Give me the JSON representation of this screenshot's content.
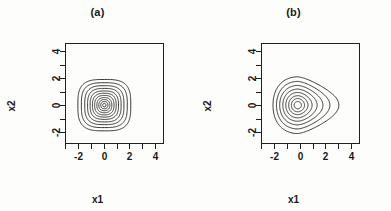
{
  "figure": {
    "background_color": "#fdfdfc",
    "ink_color": "#161616"
  },
  "panels": [
    {
      "id": "a",
      "title": "(a)",
      "xlabel": "x1",
      "ylabel": "x2"
    },
    {
      "id": "b",
      "title": "(b)",
      "xlabel": "x1",
      "ylabel": "x2"
    }
  ],
  "chart_data": [
    {
      "type": "line",
      "subtype": "contour",
      "title": "(a)",
      "xlabel": "x1",
      "ylabel": "x2",
      "xlim": [
        -3,
        4.6
      ],
      "ylim": [
        -2.8,
        4.6
      ],
      "xticks": [
        -3,
        -2,
        -1,
        0,
        1,
        2,
        3,
        4
      ],
      "xtick_labels": [
        "",
        "-2",
        "",
        "0",
        "",
        "2",
        "",
        "4"
      ],
      "yticks": [
        -2,
        -1,
        0,
        1,
        2,
        3,
        4
      ],
      "ytick_labels": [
        "-2",
        "",
        "0",
        "",
        "2",
        "",
        "4"
      ],
      "grid": false,
      "legend": "none",
      "description": "Nearly circular, concentric contours of a symmetric bivariate density centred at the origin",
      "center": [
        0.05,
        0.0
      ],
      "n_contours": 11,
      "contour_levels": [
        0.02,
        0.04,
        0.06,
        0.08,
        0.1,
        0.12,
        0.14,
        0.16,
        0.18,
        0.2,
        0.22
      ],
      "contour_radii_x": [
        2.05,
        1.78,
        1.52,
        1.3,
        1.1,
        0.92,
        0.75,
        0.58,
        0.43,
        0.28,
        0.13
      ],
      "contour_radii_y": [
        1.9,
        1.66,
        1.44,
        1.24,
        1.05,
        0.88,
        0.72,
        0.56,
        0.41,
        0.27,
        0.13
      ],
      "skew_x": 0.0,
      "squareness": [
        0.55,
        0.5,
        0.45,
        0.4,
        0.34,
        0.28,
        0.22,
        0.16,
        0.1,
        0.05,
        0.0
      ]
    },
    {
      "type": "line",
      "subtype": "contour",
      "title": "(b)",
      "xlabel": "x1",
      "ylabel": "x2",
      "xlim": [
        -3,
        4.6
      ],
      "ylim": [
        -2.8,
        4.6
      ],
      "xticks": [
        -3,
        -2,
        -1,
        0,
        1,
        2,
        3,
        4
      ],
      "xtick_labels": [
        "",
        "-2",
        "",
        "0",
        "",
        "2",
        "",
        "4"
      ],
      "yticks": [
        -2,
        -1,
        0,
        1,
        2,
        3,
        4
      ],
      "ytick_labels": [
        "-2",
        "",
        "0",
        "",
        "2",
        "",
        "4"
      ],
      "grid": false,
      "legend": "none",
      "description": "Right-skewed teardrop-shaped concentric contours of an asymmetric bivariate density centred near the origin",
      "center": [
        -0.15,
        0.0
      ],
      "n_contours": 8,
      "contour_levels": [
        0.02,
        0.05,
        0.08,
        0.11,
        0.14,
        0.17,
        0.2,
        0.23
      ],
      "contour_radii_x": [
        2.15,
        1.8,
        1.5,
        1.22,
        0.96,
        0.72,
        0.5,
        0.28
      ],
      "contour_radii_y": [
        2.1,
        1.76,
        1.46,
        1.19,
        0.94,
        0.7,
        0.49,
        0.27
      ],
      "skew_x": [
        1.15,
        0.92,
        0.72,
        0.55,
        0.38,
        0.24,
        0.12,
        0.04
      ],
      "squareness": [
        0.0,
        0.0,
        0.0,
        0.0,
        0.0,
        0.0,
        0.0,
        0.0
      ]
    }
  ]
}
